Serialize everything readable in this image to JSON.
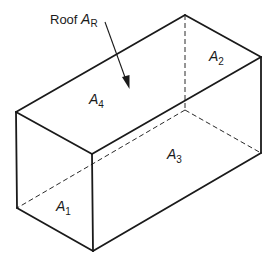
{
  "diagram": {
    "type": "isometric-box",
    "colors": {
      "stroke": "#1a1a1a",
      "background": "#ffffff"
    },
    "roof_label": {
      "prefix": "Roof ",
      "symbol": "A",
      "subscript": "R"
    },
    "faces": [
      {
        "id": "A1",
        "symbol": "A",
        "subscript": "1",
        "face": "left-end"
      },
      {
        "id": "A2",
        "symbol": "A",
        "subscript": "2",
        "face": "right-end (back)"
      },
      {
        "id": "A3",
        "symbol": "A",
        "subscript": "3",
        "face": "front-side"
      },
      {
        "id": "A4",
        "symbol": "A",
        "subscript": "4",
        "face": "back-side"
      }
    ]
  }
}
